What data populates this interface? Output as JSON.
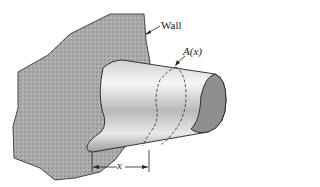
{
  "diagram": {
    "labels": {
      "wall": "Wall",
      "area": "A(x)",
      "distance": "x"
    },
    "colors": {
      "wall_fill": "#a6a6a6",
      "bar_light": "#f4f4f4",
      "bar_dark": "#9a9a9a",
      "end_face": "#8f8f8f",
      "outline": "#222222"
    }
  }
}
